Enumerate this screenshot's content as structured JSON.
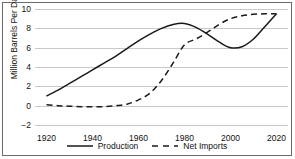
{
  "chart_data": {
    "type": "line",
    "title": "",
    "xlabel": "",
    "ylabel": "Million Barrels Per Day",
    "xlim": [
      1915,
      2025
    ],
    "ylim": [
      -2,
      10
    ],
    "grid": true,
    "legend_position": "bottom",
    "xticks": [
      1920,
      1940,
      1960,
      1980,
      2000,
      2020
    ],
    "yticks": [
      -2,
      0,
      2,
      4,
      6,
      8,
      10
    ],
    "x": [
      1920,
      1925,
      1930,
      1935,
      1940,
      1945,
      1950,
      1955,
      1960,
      1965,
      1970,
      1975,
      1980,
      1985,
      1990,
      1995,
      2000,
      2005,
      2010,
      2015,
      2020
    ],
    "series": [
      {
        "name": "Production",
        "style": "solid",
        "color": "#1a1a1a",
        "values": [
          1.0,
          1.6,
          2.3,
          3.0,
          3.7,
          4.4,
          5.1,
          5.9,
          6.7,
          7.4,
          8.0,
          8.4,
          8.5,
          8.1,
          7.4,
          6.6,
          6.0,
          6.1,
          6.9,
          8.2,
          9.5
        ]
      },
      {
        "name": "Net Imports",
        "style": "dashed",
        "color": "#1a1a1a",
        "values": [
          0.1,
          0.0,
          -0.05,
          -0.1,
          -0.1,
          -0.1,
          0.0,
          0.15,
          0.6,
          1.3,
          2.6,
          4.4,
          6.3,
          6.9,
          7.6,
          8.4,
          9.0,
          9.3,
          9.45,
          9.5,
          9.5
        ]
      }
    ]
  },
  "legend": {
    "items": [
      {
        "label": "Production",
        "style": "solid"
      },
      {
        "label": "Net Imports",
        "style": "dashed"
      }
    ]
  }
}
